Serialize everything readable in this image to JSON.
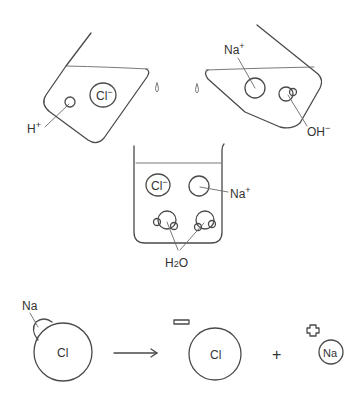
{
  "diagram": {
    "type": "chemistry-illustration",
    "colors": {
      "ink": "#4a4a4a",
      "background": "#ffffff"
    },
    "left_beaker": {
      "contents": "acid",
      "ions": [
        {
          "label": "Cl",
          "charge": "−"
        },
        {
          "label": "H",
          "charge": "+"
        }
      ]
    },
    "right_beaker": {
      "contents": "base",
      "ions": [
        {
          "label": "Na",
          "charge": "+"
        },
        {
          "label": "OH",
          "charge": "−"
        }
      ]
    },
    "center_beaker": {
      "contents": "neutralized solution",
      "ions": [
        {
          "label": "Cl",
          "charge": "−"
        },
        {
          "label": "Na",
          "charge": "+"
        }
      ],
      "molecule_label": "H",
      "molecule_subscript": "2",
      "molecule_suffix": "O"
    },
    "reaction": {
      "reactant_small": "Na",
      "reactant_large": "Cl",
      "arrow": "→",
      "product_anion": "Cl",
      "product_anion_charge_symbol": "minus-box",
      "plus": "+",
      "product_cation": "Na",
      "product_cation_charge_symbol": "plus-cross"
    }
  }
}
